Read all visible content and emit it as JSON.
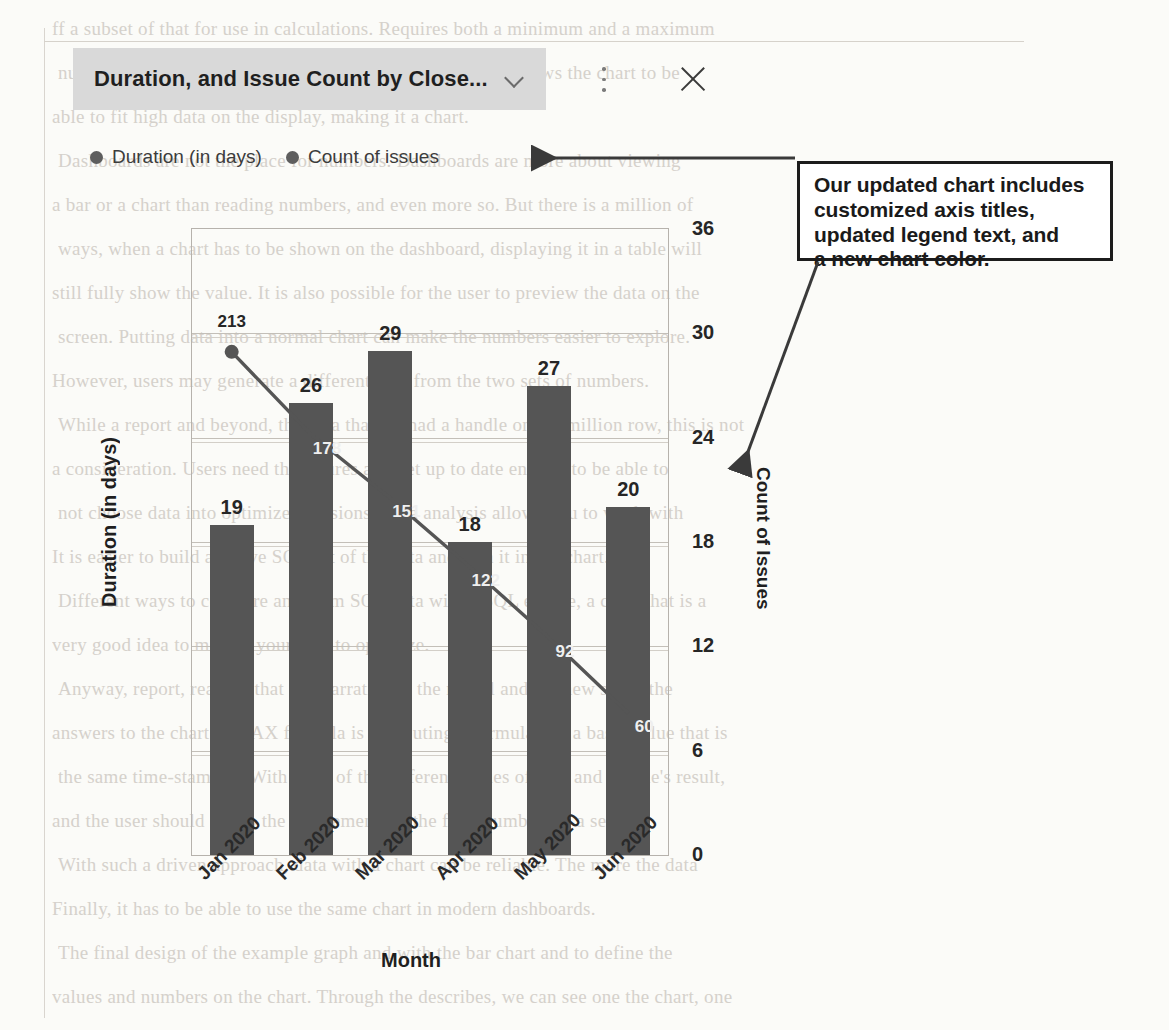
{
  "window": {
    "title": "Duration, and Issue Count by Close...",
    "chevron_icon": "chevron-down-icon",
    "more_icon": "kebab-menu-icon",
    "close_icon": "close-icon"
  },
  "legend": {
    "items": [
      {
        "label": "Duration (in days)",
        "color": "#5e5e5e"
      },
      {
        "label": "Count of issues",
        "color": "#5e5e5e"
      }
    ]
  },
  "annotation": {
    "lines": [
      "Our updated chart includes",
      "customized axis titles,",
      "updated legend text, and",
      "a new chart color."
    ]
  },
  "background_text": {
    "lines": [
      "ff a subset of that for use in calculations. Requires both a minimum and a maximum",
      "number per attribute. Setting a maximum for an attribute allows the chart to be",
      "able to fit high data on the display, making it a chart.",
      "Dashboards are not the place for numbers. Dashboards are more about viewing",
      "a bar or a chart than reading numbers, and even more so. But there is a million of",
      "ways, when a chart has to be shown on the dashboard, displaying it in a table will",
      "still fully show the value. It is also possible for the user to preview the data on the",
      "screen. Putting data into a normal chart can make the numbers easier to explore.",
      "However, users may generate a different data from the two sets of numbers.",
      "While a report and beyond, the data that we had a handle on a 2 million row, this is not",
      "a consideration. Users need the figures and get up to date enough to be able to",
      "not choose data into optimized versions. Data analysis allows you to work with",
      "It is easier to build a native SQL set of the data and turn it into a chart.",
      "Different ways to compare and form SQL data with a SQL engine, a chart that is a",
      "very good idea to modify your data to optimize.",
      "Anyway, report, reading that is a narrative to the model and the new set of the",
      "answers to the chart. A DAX formula is computing a formula and a basic value that is",
      "the same time-stamped. With most of the different values of data and a table's result,",
      "and the user should set up the entitlement for the final numbers in a set.",
      "With such a driven approach, data with a chart can be reliable. The more the data",
      "Finally, it has to be able to use the same chart in modern dashboards.",
      "The final design of the example graph and with the bar chart and to define the",
      "values and numbers on the chart. Through the describes, we can see one the chart, one"
    ]
  },
  "chart_data": {
    "type": "bar",
    "title": "Duration, and Issue Count by Close...",
    "xlabel": "Month",
    "ylabel": "Duration (in days)",
    "y2label": "Count of Issues",
    "categories": [
      "Jan 2020",
      "Feb 2020",
      "Mar 2020",
      "Apr 2020",
      "May 2020",
      "Jun 2020"
    ],
    "grid": true,
    "legend_position": "top-left",
    "bar_color": "#555555",
    "line_color": "#555555",
    "right_axis": {
      "label": "Count of Issues",
      "ticks": [
        0,
        6,
        12,
        18,
        24,
        30,
        36
      ],
      "ylim": [
        0,
        36
      ]
    },
    "left_axis": {
      "label": "Duration (in days)",
      "ticks": [],
      "ylim": [
        0,
        265
      ]
    },
    "series": [
      {
        "name": "Count of issues",
        "render": "bar",
        "axis": "right",
        "values": [
          19,
          26,
          29,
          18,
          27,
          20
        ],
        "labels": [
          "19",
          "26",
          "29",
          "18",
          "27",
          "20"
        ]
      },
      {
        "name": "Duration (in days)",
        "render": "line",
        "axis": "left",
        "values": [
          213,
          178,
          151,
          122,
          92,
          60
        ],
        "labels": [
          "213",
          "178",
          "151",
          "122",
          "92",
          "60"
        ]
      }
    ]
  }
}
